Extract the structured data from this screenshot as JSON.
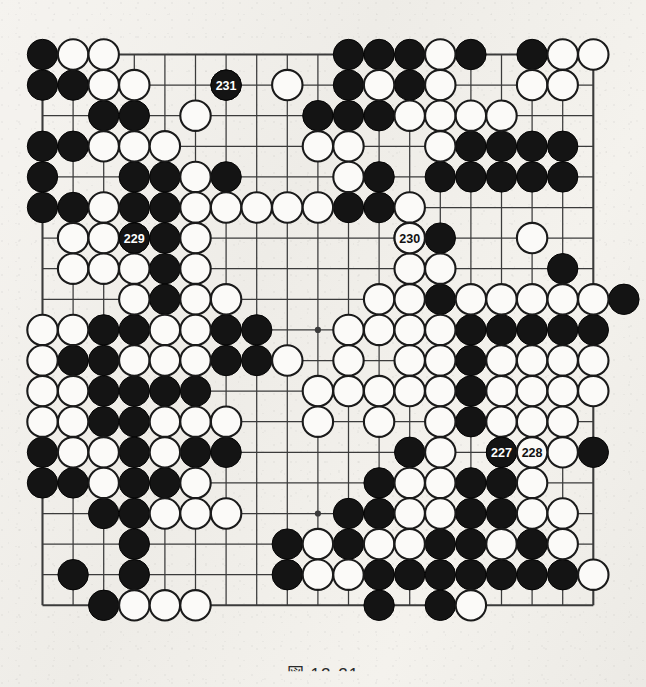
{
  "figure": {
    "type": "go-board-diagram",
    "caption": "図 12-21",
    "board_size": 19,
    "star_points": [
      [
        3,
        3
      ],
      [
        9,
        3
      ],
      [
        15,
        3
      ],
      [
        3,
        9
      ],
      [
        9,
        9
      ],
      [
        15,
        9
      ],
      [
        3,
        15
      ],
      [
        9,
        15
      ],
      [
        15,
        15
      ]
    ],
    "colors": {
      "paper": "#f2f0ec",
      "line": "#3b3b3b",
      "black_stone": "#141414",
      "white_stone": "#fbfaf8",
      "label_on_black": "#ffffff",
      "label_on_white": "#111111"
    },
    "move_labels": [
      {
        "number": "227",
        "color": "black",
        "col": 15,
        "row": 13
      },
      {
        "number": "228",
        "color": "white",
        "col": 16,
        "row": 13
      },
      {
        "number": "229",
        "color": "black",
        "col": 3,
        "row": 6
      },
      {
        "number": "230",
        "color": "white",
        "col": 12,
        "row": 6
      },
      {
        "number": "231",
        "color": "black",
        "col": 6,
        "row": 1
      }
    ],
    "black_stones": [
      [
        0,
        0
      ],
      [
        10,
        0
      ],
      [
        11,
        0
      ],
      [
        12,
        0
      ],
      [
        14,
        0
      ],
      [
        16,
        0
      ],
      [
        0,
        1
      ],
      [
        1,
        1
      ],
      [
        6,
        1
      ],
      [
        10,
        1
      ],
      [
        12,
        1
      ],
      [
        2,
        2
      ],
      [
        3,
        2
      ],
      [
        9,
        2
      ],
      [
        10,
        2
      ],
      [
        11,
        2
      ],
      [
        0,
        3
      ],
      [
        1,
        3
      ],
      [
        14,
        3
      ],
      [
        15,
        3
      ],
      [
        16,
        3
      ],
      [
        17,
        3
      ],
      [
        0,
        4
      ],
      [
        3,
        4
      ],
      [
        4,
        4
      ],
      [
        6,
        4
      ],
      [
        11,
        4
      ],
      [
        13,
        4
      ],
      [
        14,
        4
      ],
      [
        15,
        4
      ],
      [
        16,
        4
      ],
      [
        17,
        4
      ],
      [
        0,
        5
      ],
      [
        1,
        5
      ],
      [
        3,
        5
      ],
      [
        4,
        5
      ],
      [
        10,
        5
      ],
      [
        11,
        5
      ],
      [
        3,
        6
      ],
      [
        4,
        6
      ],
      [
        13,
        6
      ],
      [
        4,
        7
      ],
      [
        17,
        7
      ],
      [
        4,
        8
      ],
      [
        13,
        8
      ],
      [
        19,
        8
      ],
      [
        2,
        9
      ],
      [
        3,
        9
      ],
      [
        6,
        9
      ],
      [
        7,
        9
      ],
      [
        14,
        9
      ],
      [
        15,
        9
      ],
      [
        16,
        9
      ],
      [
        17,
        9
      ],
      [
        18,
        9
      ],
      [
        1,
        10
      ],
      [
        2,
        10
      ],
      [
        6,
        10
      ],
      [
        7,
        10
      ],
      [
        14,
        10
      ],
      [
        2,
        11
      ],
      [
        3,
        11
      ],
      [
        4,
        11
      ],
      [
        5,
        11
      ],
      [
        14,
        11
      ],
      [
        2,
        12
      ],
      [
        3,
        12
      ],
      [
        14,
        12
      ],
      [
        0,
        13
      ],
      [
        3,
        13
      ],
      [
        5,
        13
      ],
      [
        6,
        13
      ],
      [
        12,
        13
      ],
      [
        15,
        13
      ],
      [
        18,
        13
      ],
      [
        0,
        14
      ],
      [
        1,
        14
      ],
      [
        3,
        14
      ],
      [
        4,
        14
      ],
      [
        11,
        14
      ],
      [
        14,
        14
      ],
      [
        15,
        14
      ],
      [
        2,
        15
      ],
      [
        3,
        15
      ],
      [
        10,
        15
      ],
      [
        11,
        15
      ],
      [
        14,
        15
      ],
      [
        15,
        15
      ],
      [
        3,
        16
      ],
      [
        8,
        16
      ],
      [
        10,
        16
      ],
      [
        13,
        16
      ],
      [
        14,
        16
      ],
      [
        16,
        16
      ],
      [
        1,
        17
      ],
      [
        3,
        17
      ],
      [
        8,
        17
      ],
      [
        11,
        17
      ],
      [
        12,
        17
      ],
      [
        13,
        17
      ],
      [
        14,
        17
      ],
      [
        15,
        17
      ],
      [
        16,
        17
      ],
      [
        17,
        17
      ],
      [
        2,
        18
      ],
      [
        11,
        18
      ],
      [
        13,
        18
      ]
    ],
    "white_stones": [
      [
        1,
        0
      ],
      [
        2,
        0
      ],
      [
        13,
        0
      ],
      [
        17,
        0
      ],
      [
        18,
        0
      ],
      [
        2,
        1
      ],
      [
        3,
        1
      ],
      [
        8,
        1
      ],
      [
        11,
        1
      ],
      [
        13,
        1
      ],
      [
        16,
        1
      ],
      [
        17,
        1
      ],
      [
        5,
        2
      ],
      [
        12,
        2
      ],
      [
        13,
        2
      ],
      [
        14,
        2
      ],
      [
        15,
        2
      ],
      [
        2,
        3
      ],
      [
        3,
        3
      ],
      [
        4,
        3
      ],
      [
        9,
        3
      ],
      [
        10,
        3
      ],
      [
        13,
        3
      ],
      [
        5,
        4
      ],
      [
        10,
        4
      ],
      [
        2,
        5
      ],
      [
        5,
        5
      ],
      [
        6,
        5
      ],
      [
        7,
        5
      ],
      [
        8,
        5
      ],
      [
        9,
        5
      ],
      [
        12,
        5
      ],
      [
        1,
        6
      ],
      [
        2,
        6
      ],
      [
        5,
        6
      ],
      [
        12,
        6
      ],
      [
        16,
        6
      ],
      [
        1,
        7
      ],
      [
        2,
        7
      ],
      [
        3,
        7
      ],
      [
        5,
        7
      ],
      [
        12,
        7
      ],
      [
        13,
        7
      ],
      [
        3,
        8
      ],
      [
        5,
        8
      ],
      [
        6,
        8
      ],
      [
        11,
        8
      ],
      [
        12,
        8
      ],
      [
        14,
        8
      ],
      [
        15,
        8
      ],
      [
        16,
        8
      ],
      [
        17,
        8
      ],
      [
        18,
        8
      ],
      [
        0,
        9
      ],
      [
        1,
        9
      ],
      [
        4,
        9
      ],
      [
        5,
        9
      ],
      [
        10,
        9
      ],
      [
        11,
        9
      ],
      [
        12,
        9
      ],
      [
        13,
        9
      ],
      [
        0,
        10
      ],
      [
        3,
        10
      ],
      [
        4,
        10
      ],
      [
        5,
        10
      ],
      [
        8,
        10
      ],
      [
        10,
        10
      ],
      [
        12,
        10
      ],
      [
        13,
        10
      ],
      [
        15,
        10
      ],
      [
        16,
        10
      ],
      [
        17,
        10
      ],
      [
        18,
        10
      ],
      [
        0,
        11
      ],
      [
        1,
        11
      ],
      [
        9,
        11
      ],
      [
        10,
        11
      ],
      [
        11,
        11
      ],
      [
        12,
        11
      ],
      [
        13,
        11
      ],
      [
        15,
        11
      ],
      [
        16,
        11
      ],
      [
        17,
        11
      ],
      [
        18,
        11
      ],
      [
        0,
        12
      ],
      [
        1,
        12
      ],
      [
        4,
        12
      ],
      [
        5,
        12
      ],
      [
        6,
        12
      ],
      [
        9,
        12
      ],
      [
        11,
        12
      ],
      [
        13,
        12
      ],
      [
        15,
        12
      ],
      [
        16,
        12
      ],
      [
        17,
        12
      ],
      [
        1,
        13
      ],
      [
        2,
        13
      ],
      [
        4,
        13
      ],
      [
        13,
        13
      ],
      [
        16,
        13
      ],
      [
        17,
        13
      ],
      [
        2,
        14
      ],
      [
        5,
        14
      ],
      [
        12,
        14
      ],
      [
        13,
        14
      ],
      [
        16,
        14
      ],
      [
        4,
        15
      ],
      [
        5,
        15
      ],
      [
        6,
        15
      ],
      [
        12,
        15
      ],
      [
        13,
        15
      ],
      [
        16,
        15
      ],
      [
        17,
        15
      ],
      [
        9,
        16
      ],
      [
        11,
        16
      ],
      [
        12,
        16
      ],
      [
        15,
        16
      ],
      [
        17,
        16
      ],
      [
        9,
        17
      ],
      [
        10,
        17
      ],
      [
        18,
        17
      ],
      [
        3,
        18
      ],
      [
        4,
        18
      ],
      [
        5,
        18
      ],
      [
        14,
        18
      ]
    ]
  }
}
